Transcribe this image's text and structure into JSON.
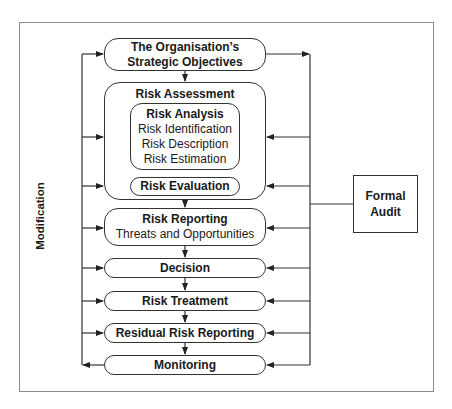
{
  "diagram": {
    "type": "risk-management-process-flowchart",
    "side_labels": {
      "left": "Modification"
    },
    "audit_box": {
      "line1": "Formal",
      "line2": "Audit"
    },
    "steps": [
      {
        "id": "objectives",
        "lines": [
          "The Organisation’s",
          "Strategic Objectives"
        ]
      },
      {
        "id": "assessment",
        "title": "Risk Assessment",
        "analysis": {
          "title": "Risk Analysis",
          "items": [
            "Risk Identification",
            "Risk Description",
            "Risk Estimation"
          ]
        },
        "evaluation": "Risk Evaluation"
      },
      {
        "id": "reporting",
        "title": "Risk Reporting",
        "subtitle": "Threats and Opportunities"
      },
      {
        "id": "decision",
        "title": "Decision"
      },
      {
        "id": "treatment",
        "title": "Risk Treatment"
      },
      {
        "id": "residual",
        "title": "Residual Risk Reporting"
      },
      {
        "id": "monitoring",
        "title": "Monitoring"
      }
    ],
    "connections": {
      "flow": "top-to-bottom arrows between consecutive steps",
      "modification_loop": "Monitoring feeds left rail; left rail arrows into every step",
      "audit_loop": "Objectives feeds right rail; right rail arrows into every step; Formal Audit connects to right rail"
    },
    "colors": {
      "stroke": "#333333",
      "frame": "#8a8a8a",
      "background": "#ffffff"
    }
  }
}
